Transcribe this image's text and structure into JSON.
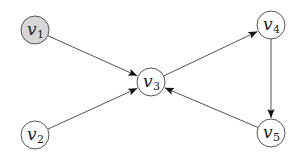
{
  "diagram": {
    "type": "directed-graph",
    "nodes": [
      {
        "id": "v1",
        "label": "v",
        "sub": "1",
        "x": 35,
        "y": 30,
        "fill": "#d6d6d6",
        "highlighted": true
      },
      {
        "id": "v2",
        "label": "v",
        "sub": "2",
        "x": 35,
        "y": 135,
        "fill": "#ffffff",
        "highlighted": false
      },
      {
        "id": "v3",
        "label": "v",
        "sub": "3",
        "x": 151,
        "y": 82,
        "fill": "#ffffff",
        "highlighted": false
      },
      {
        "id": "v4",
        "label": "v",
        "sub": "4",
        "x": 271,
        "y": 25,
        "fill": "#ffffff",
        "highlighted": false
      },
      {
        "id": "v5",
        "label": "v",
        "sub": "5",
        "x": 271,
        "y": 133,
        "fill": "#ffffff",
        "highlighted": false
      }
    ],
    "edges": [
      {
        "from": "v1",
        "to": "v3"
      },
      {
        "from": "v2",
        "to": "v3"
      },
      {
        "from": "v3",
        "to": "v4"
      },
      {
        "from": "v4",
        "to": "v5"
      },
      {
        "from": "v5",
        "to": "v3"
      }
    ],
    "node_radius": 14,
    "colors": {
      "stroke": "#555555",
      "highlight_fill": "#d6d6d6",
      "arrow": "#111111"
    }
  }
}
